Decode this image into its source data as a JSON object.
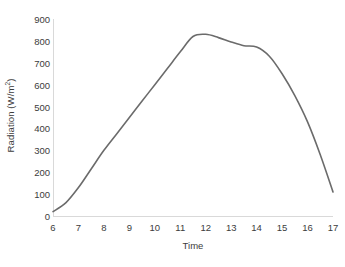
{
  "chart_data": {
    "type": "line",
    "title": "",
    "xlabel": "Time",
    "ylabel": "Radiation (W/m²)",
    "ylabel_base": "Radiation (W/m",
    "ylabel_sup": "2",
    "ylabel_tail": ")",
    "xlim": [
      6,
      17
    ],
    "ylim": [
      0,
      900
    ],
    "grid": false,
    "legend": null,
    "line_color": "#6b6b6b",
    "axis_color": "#d9d9d9",
    "x_ticks": [
      6,
      7,
      8,
      9,
      10,
      11,
      12,
      13,
      14,
      15,
      16,
      17
    ],
    "x_tick_labels": [
      "6",
      "7",
      "8",
      "9",
      "10",
      "11",
      "12",
      "13",
      "14",
      "15",
      "16",
      "17"
    ],
    "y_ticks": [
      0,
      100,
      200,
      300,
      400,
      500,
      600,
      700,
      800,
      900
    ],
    "y_tick_labels": [
      "0",
      "100",
      "200",
      "300",
      "400",
      "500",
      "600",
      "700",
      "800",
      "900"
    ],
    "series": [
      {
        "name": "Radiation",
        "x": [
          6,
          6.5,
          7,
          7.5,
          8,
          8.5,
          9,
          9.5,
          10,
          10.5,
          11,
          11.5,
          12,
          12.5,
          13,
          13.5,
          14,
          14.5,
          15,
          15.5,
          16,
          16.5,
          17
        ],
        "values": [
          20,
          60,
          130,
          215,
          300,
          375,
          450,
          525,
          600,
          675,
          750,
          820,
          830,
          815,
          795,
          778,
          772,
          730,
          650,
          550,
          430,
          280,
          110
        ]
      }
    ]
  }
}
